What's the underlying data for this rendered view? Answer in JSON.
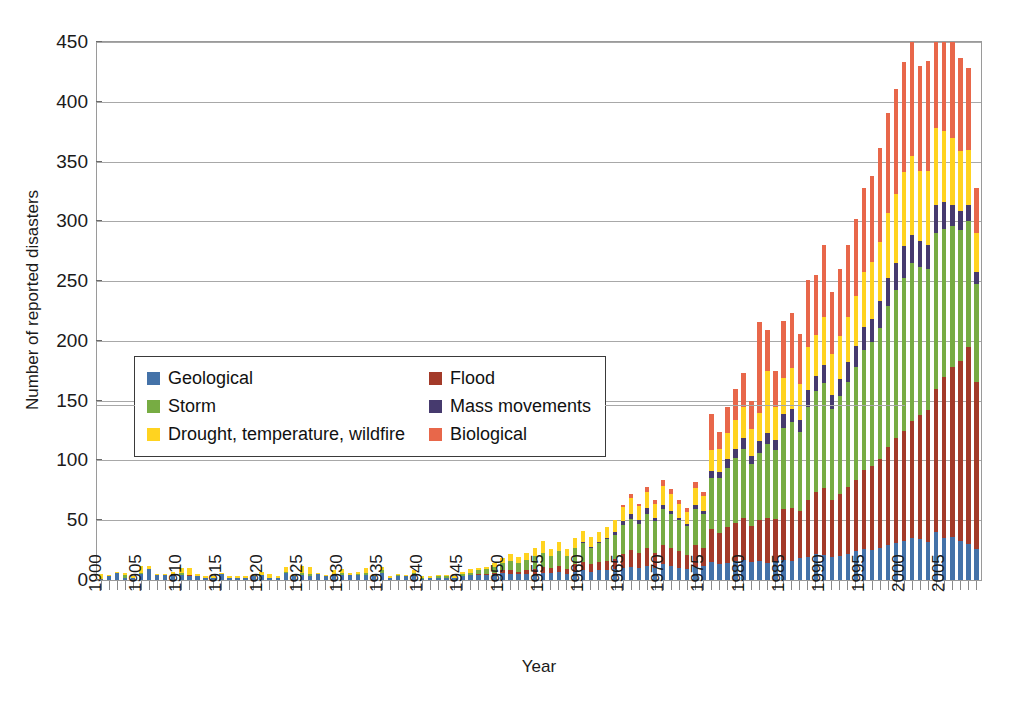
{
  "chart_data": {
    "type": "bar",
    "stacked": true,
    "title": "Natural Disaster 1900 - 2009",
    "xlabel": "Year",
    "ylabel": "Number of reported disasters",
    "ylim": [
      0,
      450
    ],
    "ytick_step": 50,
    "ytick_labels": [
      "450",
      "400",
      "350",
      "300",
      "250",
      "200",
      "150",
      "100",
      "50",
      "0"
    ],
    "grid": true,
    "legend_position": "inside-left-middle",
    "xtick_label_interval": 5,
    "xtick_labels": [
      "1900",
      "1905",
      "1910",
      "1915",
      "1920",
      "1925",
      "1930",
      "1935",
      "1940",
      "1945",
      "1950",
      "1955",
      "1960",
      "1965",
      "1970",
      "1975",
      "1980",
      "1985",
      "1990",
      "1995",
      "2000",
      "2005"
    ],
    "x": [
      1900,
      1901,
      1902,
      1903,
      1904,
      1905,
      1906,
      1907,
      1908,
      1909,
      1910,
      1911,
      1912,
      1913,
      1914,
      1915,
      1916,
      1917,
      1918,
      1919,
      1920,
      1921,
      1922,
      1923,
      1924,
      1925,
      1926,
      1927,
      1928,
      1929,
      1930,
      1931,
      1932,
      1933,
      1934,
      1935,
      1936,
      1937,
      1938,
      1939,
      1940,
      1941,
      1942,
      1943,
      1944,
      1945,
      1946,
      1947,
      1948,
      1949,
      1950,
      1951,
      1952,
      1953,
      1954,
      1955,
      1956,
      1957,
      1958,
      1959,
      1960,
      1961,
      1962,
      1963,
      1964,
      1965,
      1966,
      1967,
      1968,
      1969,
      1970,
      1971,
      1972,
      1973,
      1974,
      1975,
      1976,
      1977,
      1978,
      1979,
      1980,
      1981,
      1982,
      1983,
      1984,
      1985,
      1986,
      1987,
      1988,
      1989,
      1990,
      1991,
      1992,
      1993,
      1994,
      1995,
      1996,
      1997,
      1998,
      1999,
      2000,
      2001,
      2002,
      2003,
      2004,
      2005,
      2006,
      2007,
      2008,
      2009
    ],
    "series": [
      {
        "name": "Geological",
        "color": "#4472a8",
        "values": [
          1,
          3,
          6,
          2,
          2,
          5,
          9,
          4,
          4,
          5,
          4,
          3,
          3,
          2,
          2,
          5,
          2,
          2,
          2,
          3,
          4,
          2,
          2,
          6,
          3,
          4,
          3,
          5,
          3,
          4,
          4,
          4,
          4,
          4,
          3,
          6,
          2,
          3,
          3,
          5,
          1,
          2,
          2,
          2,
          2,
          3,
          4,
          4,
          4,
          5,
          6,
          5,
          5,
          5,
          5,
          6,
          6,
          7,
          5,
          7,
          8,
          7,
          8,
          8,
          9,
          10,
          11,
          10,
          12,
          10,
          13,
          12,
          10,
          9,
          11,
          12,
          15,
          13,
          14,
          16,
          17,
          15,
          16,
          14,
          15,
          17,
          16,
          18,
          19,
          22,
          21,
          19,
          20,
          22,
          24,
          26,
          25,
          27,
          29,
          31,
          33,
          35,
          34,
          32,
          40,
          35,
          36,
          33,
          30,
          26
        ]
      },
      {
        "name": "Flood",
        "color": "#a33a29",
        "values": [
          0,
          0,
          0,
          0,
          0,
          0,
          0,
          0,
          0,
          0,
          0,
          1,
          0,
          0,
          0,
          0,
          0,
          0,
          0,
          0,
          0,
          0,
          0,
          0,
          0,
          0,
          0,
          0,
          0,
          0,
          0,
          0,
          0,
          0,
          0,
          0,
          0,
          0,
          0,
          0,
          0,
          0,
          0,
          0,
          0,
          0,
          0,
          1,
          1,
          1,
          2,
          3,
          2,
          3,
          4,
          5,
          4,
          5,
          4,
          6,
          7,
          6,
          7,
          8,
          9,
          12,
          14,
          13,
          15,
          13,
          16,
          15,
          14,
          12,
          18,
          15,
          28,
          26,
          30,
          32,
          35,
          30,
          34,
          38,
          36,
          42,
          44,
          40,
          48,
          52,
          56,
          48,
          52,
          56,
          60,
          66,
          70,
          74,
          82,
          88,
          92,
          98,
          104,
          110,
          120,
          135,
          142,
          150,
          165,
          140
        ]
      },
      {
        "name": "Storm",
        "color": "#77ac43",
        "values": [
          0,
          0,
          0,
          2,
          0,
          1,
          0,
          0,
          0,
          0,
          2,
          0,
          0,
          0,
          0,
          0,
          0,
          0,
          0,
          0,
          0,
          0,
          0,
          1,
          0,
          2,
          2,
          0,
          0,
          1,
          2,
          0,
          1,
          2,
          0,
          2,
          0,
          1,
          0,
          1,
          1,
          0,
          1,
          1,
          0,
          2,
          2,
          3,
          4,
          5,
          6,
          8,
          7,
          9,
          11,
          12,
          10,
          12,
          11,
          14,
          16,
          14,
          16,
          18,
          20,
          24,
          26,
          24,
          28,
          26,
          30,
          28,
          26,
          24,
          30,
          28,
          42,
          46,
          50,
          54,
          58,
          52,
          56,
          62,
          58,
          68,
          72,
          66,
          78,
          84,
          88,
          76,
          82,
          88,
          94,
          100,
          104,
          110,
          118,
          124,
          128,
          132,
          124,
          118,
          130,
          124,
          118,
          110,
          105,
          82
        ]
      },
      {
        "name": "Mass movements",
        "color": "#463a6e",
        "values": [
          0,
          0,
          0,
          0,
          0,
          0,
          0,
          0,
          0,
          0,
          0,
          0,
          0,
          0,
          0,
          0,
          0,
          0,
          0,
          0,
          0,
          0,
          0,
          0,
          0,
          0,
          0,
          0,
          0,
          0,
          0,
          0,
          0,
          0,
          0,
          0,
          0,
          0,
          0,
          0,
          0,
          0,
          0,
          0,
          0,
          0,
          0,
          0,
          0,
          0,
          0,
          0,
          0,
          0,
          0,
          0,
          0,
          0,
          0,
          0,
          1,
          1,
          1,
          1,
          2,
          3,
          4,
          3,
          5,
          3,
          4,
          3,
          2,
          2,
          4,
          3,
          6,
          5,
          7,
          8,
          9,
          7,
          10,
          9,
          8,
          12,
          11,
          10,
          14,
          13,
          15,
          12,
          14,
          16,
          18,
          20,
          19,
          22,
          24,
          22,
          26,
          24,
          22,
          20,
          24,
          22,
          18,
          16,
          14,
          10
        ]
      },
      {
        "name": "Drought, temperature, wildfire",
        "color": "#ffd320",
        "values": [
          4,
          1,
          1,
          2,
          1,
          6,
          3,
          1,
          1,
          2,
          4,
          6,
          2,
          1,
          1,
          1,
          1,
          1,
          1,
          1,
          3,
          3,
          1,
          4,
          1,
          6,
          6,
          1,
          1,
          3,
          3,
          2,
          2,
          4,
          2,
          3,
          1,
          1,
          1,
          2,
          1,
          1,
          1,
          1,
          1,
          2,
          3,
          2,
          2,
          3,
          4,
          6,
          5,
          6,
          7,
          10,
          6,
          8,
          6,
          8,
          9,
          8,
          8,
          9,
          10,
          12,
          14,
          12,
          14,
          12,
          16,
          14,
          12,
          10,
          14,
          12,
          18,
          20,
          22,
          24,
          26,
          22,
          24,
          52,
          28,
          30,
          34,
          30,
          36,
          34,
          40,
          34,
          36,
          38,
          42,
          46,
          48,
          50,
          54,
          58,
          62,
          66,
          58,
          62,
          64,
          60,
          56,
          50,
          46,
          32
        ]
      },
      {
        "name": "Biological",
        "color": "#e8674a",
        "values": [
          0,
          0,
          0,
          0,
          0,
          0,
          0,
          0,
          0,
          0,
          0,
          0,
          0,
          0,
          0,
          0,
          0,
          0,
          0,
          0,
          0,
          0,
          0,
          0,
          0,
          0,
          0,
          0,
          0,
          0,
          0,
          0,
          0,
          0,
          0,
          0,
          0,
          0,
          0,
          0,
          0,
          0,
          0,
          0,
          0,
          0,
          0,
          0,
          0,
          0,
          0,
          0,
          0,
          0,
          0,
          0,
          0,
          0,
          0,
          0,
          0,
          0,
          0,
          0,
          0,
          2,
          3,
          2,
          4,
          3,
          5,
          4,
          3,
          3,
          5,
          4,
          30,
          14,
          22,
          26,
          28,
          24,
          76,
          34,
          30,
          48,
          46,
          42,
          56,
          50,
          60,
          52,
          56,
          60,
          64,
          70,
          72,
          78,
          84,
          88,
          92,
          96,
          88,
          92,
          98,
          90,
          86,
          78,
          68,
          38
        ]
      }
    ]
  },
  "legend": {
    "items": [
      {
        "label": "Geological",
        "color": "#4472a8",
        "key": "geological"
      },
      {
        "label": "Flood",
        "color": "#a33a29",
        "key": "flood"
      },
      {
        "label": "Storm",
        "color": "#77ac43",
        "key": "storm"
      },
      {
        "label": "Mass movements",
        "color": "#463a6e",
        "key": "mass-movements"
      },
      {
        "label": "Drought, temperature, wildfire",
        "color": "#ffd320",
        "key": "drought-temperature-wildfire"
      },
      {
        "label": "Biological",
        "color": "#e8674a",
        "key": "biological"
      }
    ]
  },
  "colors": {
    "gridline": "#a8a8a8",
    "frame": "#9a9a9a",
    "text": "#1a1a1a",
    "background": "#ffffff"
  }
}
